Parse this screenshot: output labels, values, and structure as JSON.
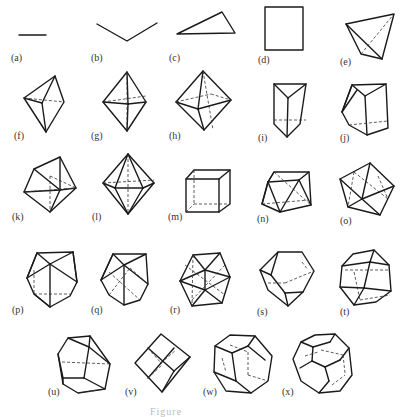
{
  "figure": {
    "labels": {
      "a": "(a)",
      "b": "(b)",
      "c": "(c)",
      "d": "(d)",
      "e": "(e)",
      "f": "(f)",
      "g": "(g)",
      "h": "(h)",
      "i": "(i)",
      "j": "(j)",
      "k": "(k)",
      "l": "(l)",
      "m": "(m)",
      "n": "(n)",
      "o": "(o)",
      "p": "(p)",
      "q": "(q)",
      "r": "(r)",
      "s": "(s)",
      "t": "(t)",
      "u": "(u)",
      "v": "(v)",
      "w": "(w)",
      "x": "(x)"
    },
    "shapes": [
      {
        "id": "a",
        "name": "line-segment"
      },
      {
        "id": "b",
        "name": "bent-line"
      },
      {
        "id": "c",
        "name": "triangle"
      },
      {
        "id": "d",
        "name": "square"
      },
      {
        "id": "e",
        "name": "tetrahedron"
      },
      {
        "id": "f",
        "name": "trigonal-bipyramid"
      },
      {
        "id": "g",
        "name": "octahedron"
      },
      {
        "id": "h",
        "name": "pentagonal-bipyramid"
      },
      {
        "id": "i",
        "name": "trigonal-prism"
      },
      {
        "id": "j",
        "name": "capped-trigonal-prism"
      },
      {
        "id": "k",
        "name": "polyhedron-k"
      },
      {
        "id": "l",
        "name": "bicapped-polyhedron"
      },
      {
        "id": "m",
        "name": "cube"
      },
      {
        "id": "n",
        "name": "square-antiprism"
      },
      {
        "id": "o",
        "name": "polyhedron-o"
      },
      {
        "id": "p",
        "name": "polyhedron-p"
      },
      {
        "id": "q",
        "name": "polyhedron-q"
      },
      {
        "id": "r",
        "name": "icosahedron"
      },
      {
        "id": "s",
        "name": "polyhedron-s"
      },
      {
        "id": "t",
        "name": "polyhedron-t"
      },
      {
        "id": "u",
        "name": "polyhedron-u"
      },
      {
        "id": "v",
        "name": "rhombic-dodecahedron"
      },
      {
        "id": "w",
        "name": "dodecahedron"
      },
      {
        "id": "x",
        "name": "truncated-polyhedron"
      }
    ],
    "caption": "Figure"
  }
}
